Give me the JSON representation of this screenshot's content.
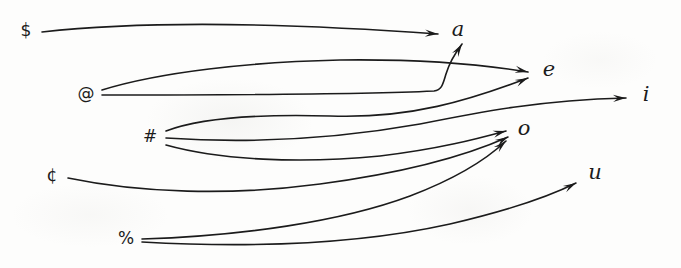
{
  "figure": {
    "kind": "mapping-diagram",
    "width": 681,
    "height": 268,
    "background_color": "#fdfdfc",
    "ink_color": "#1b1b1b",
    "stroke_width": 1.6,
    "arrow_count": 9
  },
  "sources": [
    {
      "id": "dollar",
      "label": "$",
      "x": 26,
      "y": 30,
      "out_degree": 1
    },
    {
      "id": "at",
      "label": "@",
      "x": 86,
      "y": 93,
      "out_degree": 2
    },
    {
      "id": "hash",
      "label": "#",
      "x": 150,
      "y": 136,
      "out_degree": 3
    },
    {
      "id": "cent",
      "label": "¢",
      "x": 52,
      "y": 175,
      "out_degree": 1
    },
    {
      "id": "percent",
      "label": "%",
      "x": 126,
      "y": 238,
      "out_degree": 2
    }
  ],
  "targets": [
    {
      "id": "a",
      "label": "a",
      "x": 458,
      "y": 29,
      "in_degree": 3
    },
    {
      "id": "e",
      "label": "e",
      "x": 549,
      "y": 69,
      "in_degree": 2
    },
    {
      "id": "i",
      "label": "i",
      "x": 646,
      "y": 94,
      "in_degree": 1
    },
    {
      "id": "o",
      "label": "o",
      "x": 524,
      "y": 128,
      "in_degree": 2
    },
    {
      "id": "u",
      "label": "u",
      "x": 595,
      "y": 172,
      "in_degree": 1
    }
  ],
  "edges": [
    {
      "id": "dollar-a",
      "from": "$",
      "to": "a",
      "path": "M 42 32 C 150 20, 300 24, 438 34",
      "arrow_angle": 4
    },
    {
      "id": "at-a",
      "from": "@",
      "to": "a",
      "path": "M 102 95 C 200 95, 370 94, 434 91 C 442 90, 443 84, 446 74 C 449 64, 456 52, 462 44",
      "arrow_angle": -58
    },
    {
      "id": "at-e",
      "from": "@",
      "to": "e",
      "path": "M 102 90 C 160 72, 250 62, 340 60 C 420 59, 480 64, 528 72",
      "arrow_angle": 12
    },
    {
      "id": "hash-e",
      "from": "#",
      "to": "e",
      "path": "M 166 131 C 200 118, 260 114, 330 116 C 410 119, 470 100, 528 78",
      "arrow_angle": -24
    },
    {
      "id": "hash-i",
      "from": "#",
      "to": "i",
      "path": "M 166 138 C 240 143, 330 140, 420 124 C 480 112, 540 100, 626 98",
      "arrow_angle": -2
    },
    {
      "id": "hash-o",
      "from": "#",
      "to": "o",
      "path": "M 166 145 C 220 160, 300 164, 380 156 C 440 149, 480 138, 506 131",
      "arrow_angle": -14
    },
    {
      "id": "cent-o",
      "from": "¢",
      "to": "o",
      "path": "M 68 178 C 140 193, 230 196, 320 184 C 410 172, 470 154, 508 137",
      "arrow_angle": -28
    },
    {
      "id": "percent-o",
      "from": "%",
      "to": "o",
      "path": "M 142 239 C 240 236, 340 222, 410 196 C 460 177, 490 156, 506 141",
      "arrow_angle": -42
    },
    {
      "id": "percent-u",
      "from": "%",
      "to": "u",
      "path": "M 142 242 C 250 248, 360 244, 450 224 C 510 210, 550 196, 576 183",
      "arrow_angle": -28
    }
  ]
}
